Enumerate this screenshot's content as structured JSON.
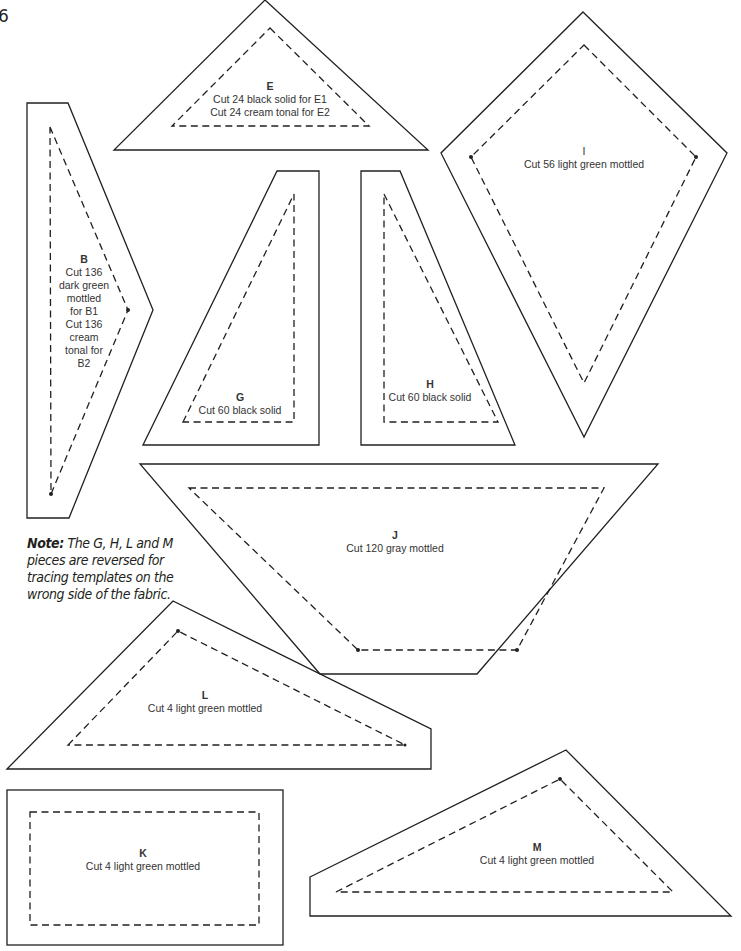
{
  "page": {
    "number": "6"
  },
  "note": {
    "prefix": "Note:",
    "text": "The G, H, L and M pieces are reversed for tracing templates on the wrong side of the fabric."
  },
  "colors": {
    "line": "#231f20",
    "text": "#333333",
    "background": "#ffffff"
  },
  "pieces": {
    "E": {
      "letter": "E",
      "lines": [
        "Cut 24 black solid for E1",
        "Cut 24 cream tonal for E2"
      ]
    },
    "B": {
      "letter": "B",
      "lines": [
        "Cut 136",
        "dark green",
        "mottled",
        "for B1",
        "Cut 136",
        "cream",
        "tonal for",
        "B2"
      ]
    },
    "I": {
      "letter": "I",
      "lines": [
        "Cut 56 light green mottled"
      ]
    },
    "G": {
      "letter": "G",
      "lines": [
        "Cut 60 black solid"
      ]
    },
    "H": {
      "letter": "H",
      "lines": [
        "Cut 60 black solid"
      ]
    },
    "J": {
      "letter": "J",
      "lines": [
        "Cut 120 gray mottled"
      ]
    },
    "L": {
      "letter": "L",
      "lines": [
        "Cut 4 light green mottled"
      ]
    },
    "K": {
      "letter": "K",
      "lines": [
        "Cut 4 light green mottled"
      ]
    },
    "M": {
      "letter": "M",
      "lines": [
        "Cut 4 light green mottled"
      ]
    }
  }
}
